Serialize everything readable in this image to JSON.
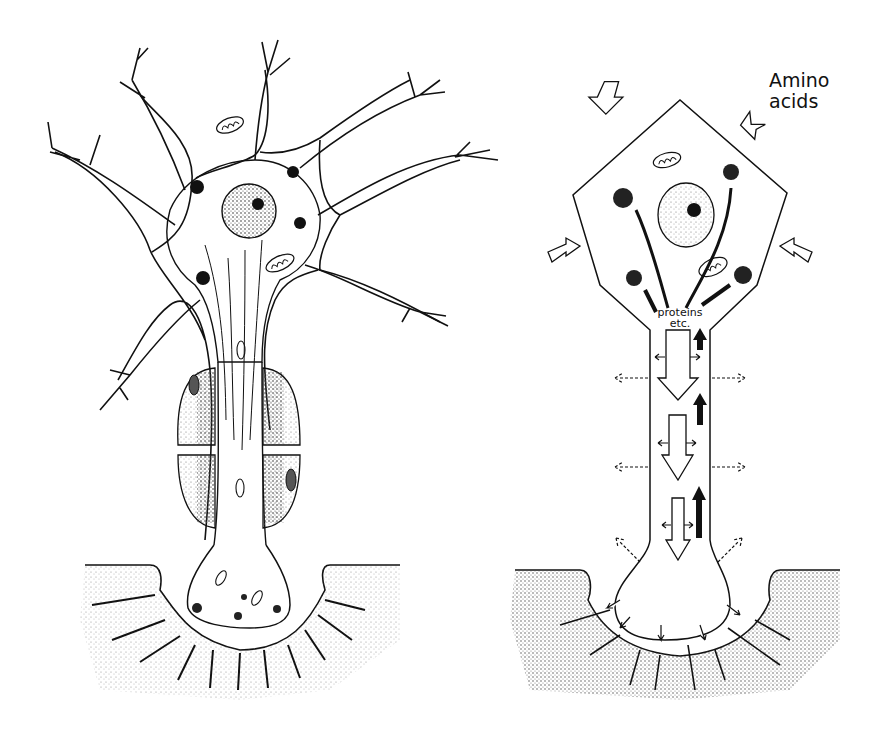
{
  "figure": {
    "left_panel": {
      "name": "neuron-with-myelinated-axon-and-terminal",
      "parts": [
        "dendrites",
        "cell body",
        "nucleus",
        "nucleolus",
        "mitochondria",
        "Nissl bodies",
        "neurofibrils",
        "myelin sheath",
        "Schwann cell",
        "axon terminal",
        "synaptic cleft",
        "postsynaptic membrane folds"
      ]
    },
    "right_panel": {
      "name": "axonal-transport-schematic",
      "labels": {
        "amino_line1": "Amino",
        "amino_line2": "acids",
        "proteins_line1": "proteins",
        "proteins_line2": "etc."
      },
      "arrows": {
        "inward_amino_acid_arrows": 4,
        "anterograde_hollow_arrows": 3,
        "retrograde_solid_arrows": 3,
        "lateral_dashed_arrows": 6,
        "terminal_release_arrows": 5
      }
    },
    "colors": {
      "ink": "#111111",
      "background": "#ffffff",
      "stipple": "#555555"
    }
  }
}
